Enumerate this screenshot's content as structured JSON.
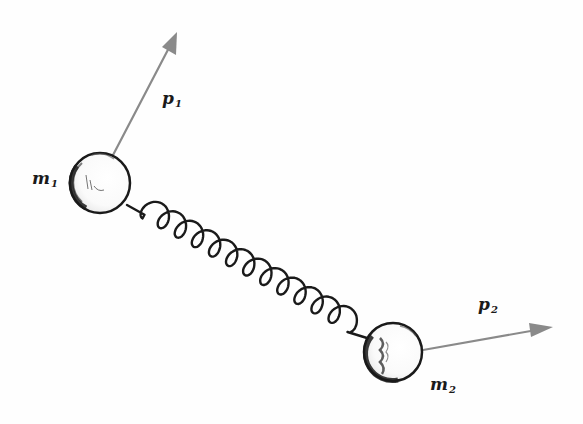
{
  "diagram": {
    "type": "physics-sketch",
    "colors": {
      "background": "#fefefe",
      "ink": "#1a1a1a",
      "arrow": "#8a8a8a"
    },
    "masses": [
      {
        "id": "m1",
        "label": "m",
        "subscript": "1",
        "center": [
          100,
          183
        ],
        "radius": 30
      },
      {
        "id": "m2",
        "label": "m",
        "subscript": "2",
        "center": [
          393,
          352
        ],
        "radius": 29
      }
    ],
    "momenta": [
      {
        "id": "p1",
        "label": "p",
        "subscript": "1",
        "from": [
          112,
          157
        ],
        "to": [
          177,
          32
        ]
      },
      {
        "id": "p2",
        "label": "p",
        "subscript": "2",
        "from": [
          423,
          350
        ],
        "to": [
          553,
          327
        ]
      }
    ],
    "spring": {
      "from": [
        127,
        205
      ],
      "to": [
        367,
        338
      ],
      "coils": 12
    }
  },
  "labels": {
    "m1": {
      "main": "m",
      "sub": "1"
    },
    "m2": {
      "main": "m",
      "sub": "2"
    },
    "p1": {
      "main": "p",
      "sub": "1"
    },
    "p2": {
      "main": "p",
      "sub": "2"
    }
  }
}
